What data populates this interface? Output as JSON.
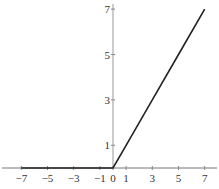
{
  "chart_data": {
    "type": "line",
    "title": "",
    "xlabel": "",
    "ylabel": "",
    "xlim": [
      -7.6,
      7.6
    ],
    "ylim": [
      0,
      7.3
    ],
    "grid": false,
    "legend": null,
    "x_ticks": [
      -7,
      -5,
      -3,
      -1,
      0,
      1,
      3,
      5,
      7
    ],
    "x_tick_labels": [
      "−7",
      "−5",
      "−3",
      "−1",
      "0",
      "1",
      "3",
      "5",
      "7"
    ],
    "y_ticks": [
      1,
      3,
      5,
      7
    ],
    "y_tick_labels": [
      "1",
      "3",
      "5",
      "7"
    ],
    "series": [
      {
        "name": "f(x) = max(0, x)",
        "x": [
          -7,
          -5,
          -3,
          -1,
          0,
          1,
          3,
          5,
          7
        ],
        "y": [
          0,
          0,
          0,
          0,
          0,
          1,
          3,
          5,
          7
        ],
        "color": "#222222"
      }
    ]
  }
}
